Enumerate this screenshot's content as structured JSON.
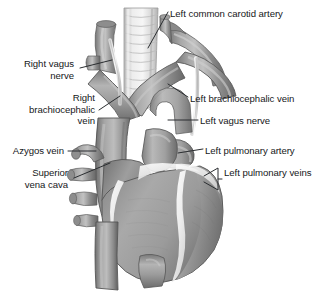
{
  "figure": {
    "kind": "anatomical-illustration",
    "background_color": "#ffffff",
    "text_color": "#16181a",
    "leader_color": "#2a2d30",
    "palette": {
      "vessel_mid": "#9a9a9a",
      "vessel_dark": "#6f6f6f",
      "vessel_light": "#c9c9c9",
      "trachea_light": "#e4e4e4",
      "trachea_ring": "#bdbdbd",
      "myocardium": "#9d9d9d",
      "fat_highlight": "#f2f2f2",
      "outline": "#5c5c5c"
    }
  },
  "labels": [
    {
      "id": "left-common-carotid-artery",
      "text": "Left common carotid artery",
      "align": "left",
      "x": 170,
      "y": 8,
      "leader": "diagonal-down-left"
    },
    {
      "id": "right-vagus-nerve",
      "text": "Right vagus\nnerve",
      "align": "right",
      "x": 14,
      "y": 58,
      "leader": "diagonal-up-right"
    },
    {
      "id": "right-brachiocephalic-vein",
      "text": "Right\nbrachiocephalic\nvein",
      "align": "right",
      "x": 4,
      "y": 92,
      "leader": "diagonal-up-right"
    },
    {
      "id": "left-brachiocephalic-vein",
      "text": "Left brachiocephalic vein",
      "align": "left",
      "x": 190,
      "y": 93,
      "leader": "diagonal-up-left"
    },
    {
      "id": "left-vagus-nerve",
      "text": "Left vagus nerve",
      "align": "left",
      "x": 200,
      "y": 115,
      "leader": "horizontal-left"
    },
    {
      "id": "azygos-vein",
      "text": "Azygos vein",
      "align": "right",
      "x": 12,
      "y": 145,
      "leader": "horizontal-right"
    },
    {
      "id": "left-pulmonary-artery",
      "text": "Left pulmonary artery",
      "align": "left",
      "x": 205,
      "y": 145,
      "leader": "horizontal-left"
    },
    {
      "id": "superior-vena-cava",
      "text": "Superior\nvena cava",
      "align": "right",
      "x": 20,
      "y": 167,
      "leader": "diagonal-up-right"
    },
    {
      "id": "left-pulmonary-veins",
      "text": "Left pulmonary veins",
      "align": "left",
      "x": 224,
      "y": 167,
      "leader": "bracket-left"
    }
  ],
  "structures": [
    "trachea",
    "left common carotid artery",
    "left subclavian artery",
    "right brachiocephalic vein",
    "left brachiocephalic vein",
    "right vagus nerve",
    "left vagus nerve",
    "superior vena cava",
    "azygos vein",
    "left pulmonary artery",
    "left pulmonary veins",
    "aortic arch",
    "pulmonary trunk",
    "right atrium",
    "right ventricle",
    "left ventricle",
    "descending aorta"
  ]
}
